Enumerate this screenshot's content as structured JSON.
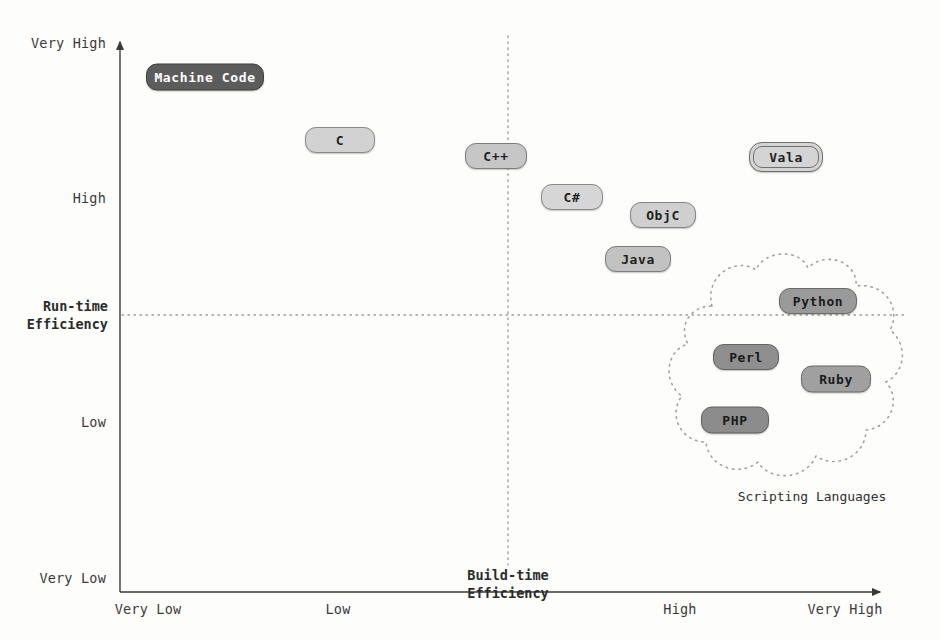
{
  "chart_data": {
    "type": "scatter",
    "title": "",
    "xlabel": "Build-time Efficiency",
    "ylabel": "Run-time Efficiency",
    "xticks": [
      "Very Low",
      "Low",
      "High",
      "Very High"
    ],
    "yticks": [
      "Very High",
      "High",
      "Low",
      "Very Low"
    ],
    "xlim": [
      "Very Low",
      "Very High"
    ],
    "ylim": [
      "Very Low",
      "Very High"
    ],
    "grid": "dotted crosshair at mid axes",
    "legend": "none",
    "annotations": [
      "Scripting Languages"
    ],
    "points": [
      {
        "name": "Machine Code",
        "x": "Very Low+",
        "y": "Very High-",
        "px": 205,
        "py": 77,
        "w": 118,
        "h": 27,
        "fill": "#5c5c5c",
        "text": "#ffffff",
        "border": "#3f3f3f",
        "double": false
      },
      {
        "name": "C",
        "x": "Low",
        "y": "Very High-",
        "px": 340,
        "py": 140,
        "w": 70,
        "h": 26,
        "fill": "#d2d2d2",
        "text": "#1f1f1f",
        "border": "#8a8a8a",
        "double": false
      },
      {
        "name": "C++",
        "x": "Low+",
        "y": "High+",
        "px": 496,
        "py": 156,
        "w": 62,
        "h": 26,
        "fill": "#c6c6c6",
        "text": "#1f1f1f",
        "border": "#7d7d7d",
        "double": false
      },
      {
        "name": "C#",
        "x": "Low++",
        "y": "High",
        "px": 572,
        "py": 197,
        "w": 62,
        "h": 26,
        "fill": "#d6d6d6",
        "text": "#1f1f1f",
        "border": "#8a8a8a",
        "double": false
      },
      {
        "name": "ObjC",
        "x": "High-",
        "y": "High-",
        "px": 663,
        "py": 215,
        "w": 66,
        "h": 26,
        "fill": "#cfcfcf",
        "text": "#1f1f1f",
        "border": "#858585",
        "double": false
      },
      {
        "name": "Java",
        "x": "High-",
        "y": "High--",
        "px": 638,
        "py": 259,
        "w": 66,
        "h": 26,
        "fill": "#c2c2c2",
        "text": "#1f1f1f",
        "border": "#7d7d7d",
        "double": false
      },
      {
        "name": "Vala",
        "x": "Very High-",
        "y": "High++",
        "px": 786,
        "py": 157,
        "w": 74,
        "h": 30,
        "fill": "#d4d4d4",
        "text": "#1f1f1f",
        "border": "#6f6f6f",
        "double": true
      },
      {
        "name": "Python",
        "x": "Very High-",
        "y": "Run-time Efficiency+",
        "px": 818,
        "py": 301,
        "w": 78,
        "h": 26,
        "fill": "#9a9a9a",
        "text": "#1a1a1a",
        "border": "#6a6a6a",
        "double": false
      },
      {
        "name": "Perl",
        "x": "High+",
        "y": "Low+",
        "px": 746,
        "py": 357,
        "w": 66,
        "h": 26,
        "fill": "#8f8f8f",
        "text": "#1a1a1a",
        "border": "#636363",
        "double": false
      },
      {
        "name": "Ruby",
        "x": "Very High-",
        "y": "Low+",
        "px": 836,
        "py": 379,
        "w": 70,
        "h": 27,
        "fill": "#a0a0a0",
        "text": "#1a1a1a",
        "border": "#6a6a6a",
        "double": false
      },
      {
        "name": "PHP",
        "x": "High",
        "y": "Low",
        "px": 735,
        "py": 420,
        "w": 68,
        "h": 27,
        "fill": "#8c8c8c",
        "text": "#1a1a1a",
        "border": "#606060",
        "double": false
      }
    ],
    "group": {
      "label": "Scripting Languages",
      "members": [
        "Python",
        "Perl",
        "Ruby",
        "PHP"
      ],
      "label_x": 812,
      "label_y": 496
    }
  },
  "axes": {
    "y_title": "Run-time\nEfficiency",
    "x_title": "Build-time\nEfficiency",
    "y_ticks": [
      {
        "label": "Very High",
        "y": 43
      },
      {
        "label": "High",
        "y": 198
      },
      {
        "label": "Low",
        "y": 422
      },
      {
        "label": "Very Low",
        "y": 578
      }
    ],
    "x_ticks": [
      {
        "label": "Very Low",
        "x": 148
      },
      {
        "label": "Low",
        "x": 338
      },
      {
        "label": "High",
        "x": 680
      },
      {
        "label": "Very High",
        "x": 845
      }
    ],
    "origin_x": 120,
    "origin_y": 592,
    "mid_x": 508,
    "mid_y": 315
  },
  "colors": {
    "axis": "#3a3a3a",
    "dotted": "#9a9a9a",
    "background": "#fdfdfc",
    "text": "#2b2b2b",
    "dark_node": "#5c5c5c",
    "light_node": "#d2d2d2",
    "mid_node": "#9a9a9a"
  }
}
